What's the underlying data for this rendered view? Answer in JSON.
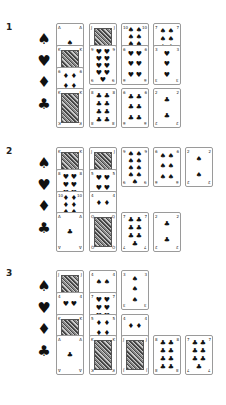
{
  "sections": [
    {
      "number": "1",
      "label_y": 22
    },
    {
      "number": "2",
      "label_y": 146
    },
    {
      "number": "3",
      "label_y": 268
    }
  ],
  "suits": [
    {
      "name": "spades",
      "glyph": "♠"
    },
    {
      "name": "hearts",
      "glyph": "♥"
    },
    {
      "name": "diamonds",
      "glyph": "♦"
    },
    {
      "name": "clubs",
      "glyph": "♣"
    }
  ],
  "cards": [
    {
      "section": 1,
      "x": 56,
      "y": 23,
      "rank": "A",
      "suit": "♠",
      "pips": 1,
      "face": false
    },
    {
      "section": 1,
      "x": 56,
      "y": 45,
      "rank": "K",
      "suit": "♥",
      "pips": 0,
      "face": true
    },
    {
      "section": 1,
      "x": 56,
      "y": 67,
      "rank": "6",
      "suit": "♦",
      "pips": 6,
      "face": false
    },
    {
      "section": 1,
      "x": 56,
      "y": 88,
      "rank": "K",
      "suit": "♣",
      "pips": 0,
      "face": true
    },
    {
      "section": 1,
      "x": 89,
      "y": 23,
      "rank": "J",
      "suit": "♠",
      "pips": 0,
      "face": true
    },
    {
      "section": 1,
      "x": 89,
      "y": 45,
      "rank": "9",
      "suit": "♥",
      "pips": 9,
      "face": false
    },
    {
      "section": 1,
      "x": 89,
      "y": 88,
      "rank": "8",
      "suit": "♣",
      "pips": 8,
      "face": false
    },
    {
      "section": 1,
      "x": 121,
      "y": 23,
      "rank": "10",
      "suit": "♠",
      "pips": 10,
      "face": false
    },
    {
      "section": 1,
      "x": 121,
      "y": 45,
      "rank": "6",
      "suit": "♥",
      "pips": 6,
      "face": false
    },
    {
      "section": 1,
      "x": 121,
      "y": 88,
      "rank": "6",
      "suit": "♣",
      "pips": 6,
      "face": false
    },
    {
      "section": 1,
      "x": 153,
      "y": 23,
      "rank": "7",
      "suit": "♠",
      "pips": 7,
      "face": false
    },
    {
      "section": 1,
      "x": 153,
      "y": 45,
      "rank": "3",
      "suit": "♥",
      "pips": 3,
      "face": false
    },
    {
      "section": 1,
      "x": 153,
      "y": 88,
      "rank": "2",
      "suit": "♣",
      "pips": 2,
      "face": false
    },
    {
      "section": 2,
      "x": 56,
      "y": 147,
      "rank": "K",
      "suit": "♠",
      "pips": 0,
      "face": true
    },
    {
      "section": 2,
      "x": 56,
      "y": 169,
      "rank": "8",
      "suit": "♥",
      "pips": 8,
      "face": false
    },
    {
      "section": 2,
      "x": 56,
      "y": 191,
      "rank": "10",
      "suit": "♦",
      "pips": 10,
      "face": false
    },
    {
      "section": 2,
      "x": 56,
      "y": 212,
      "rank": "A",
      "suit": "♣",
      "pips": 1,
      "face": false
    },
    {
      "section": 2,
      "x": 89,
      "y": 147,
      "rank": "J",
      "suit": "♠",
      "pips": 0,
      "face": true
    },
    {
      "section": 2,
      "x": 89,
      "y": 169,
      "rank": "5",
      "suit": "♥",
      "pips": 5,
      "face": false
    },
    {
      "section": 2,
      "x": 89,
      "y": 191,
      "rank": "4",
      "suit": "♦",
      "pips": 4,
      "face": false
    },
    {
      "section": 2,
      "x": 89,
      "y": 212,
      "rank": "Q",
      "suit": "♣",
      "pips": 0,
      "face": true
    },
    {
      "section": 2,
      "x": 121,
      "y": 147,
      "rank": "9",
      "suit": "♠",
      "pips": 9,
      "face": false
    },
    {
      "section": 2,
      "x": 121,
      "y": 212,
      "rank": "7",
      "suit": "♣",
      "pips": 7,
      "face": false
    },
    {
      "section": 2,
      "x": 153,
      "y": 147,
      "rank": "6",
      "suit": "♠",
      "pips": 6,
      "face": false
    },
    {
      "section": 2,
      "x": 153,
      "y": 212,
      "rank": "2",
      "suit": "♣",
      "pips": 2,
      "face": false
    },
    {
      "section": 2,
      "x": 185,
      "y": 147,
      "rank": "2",
      "suit": "♠",
      "pips": 2,
      "face": false
    },
    {
      "section": 3,
      "x": 56,
      "y": 270,
      "rank": "J",
      "suit": "♠",
      "pips": 0,
      "face": true
    },
    {
      "section": 3,
      "x": 56,
      "y": 292,
      "rank": "4",
      "suit": "♥",
      "pips": 4,
      "face": false
    },
    {
      "section": 3,
      "x": 56,
      "y": 314,
      "rank": "K",
      "suit": "♦",
      "pips": 0,
      "face": true
    },
    {
      "section": 3,
      "x": 56,
      "y": 335,
      "rank": "A",
      "suit": "♣",
      "pips": 1,
      "face": false
    },
    {
      "section": 3,
      "x": 89,
      "y": 270,
      "rank": "4",
      "suit": "♠",
      "pips": 4,
      "face": false
    },
    {
      "section": 3,
      "x": 89,
      "y": 292,
      "rank": "7",
      "suit": "♥",
      "pips": 7,
      "face": false
    },
    {
      "section": 3,
      "x": 89,
      "y": 314,
      "rank": "5",
      "suit": "♦",
      "pips": 5,
      "face": false
    },
    {
      "section": 3,
      "x": 89,
      "y": 335,
      "rank": "K",
      "suit": "♣",
      "pips": 0,
      "face": true
    },
    {
      "section": 3,
      "x": 121,
      "y": 270,
      "rank": "3",
      "suit": "♠",
      "pips": 3,
      "face": false
    },
    {
      "section": 3,
      "x": 121,
      "y": 314,
      "rank": "4",
      "suit": "♦",
      "pips": 4,
      "face": false
    },
    {
      "section": 3,
      "x": 121,
      "y": 335,
      "rank": "J",
      "suit": "♣",
      "pips": 0,
      "face": true
    },
    {
      "section": 3,
      "x": 153,
      "y": 335,
      "rank": "8",
      "suit": "♣",
      "pips": 8,
      "face": false
    },
    {
      "section": 3,
      "x": 185,
      "y": 335,
      "rank": "7",
      "suit": "♣",
      "pips": 7,
      "face": false
    }
  ],
  "suit_row_offsets": [
    32,
    54,
    75,
    97
  ]
}
